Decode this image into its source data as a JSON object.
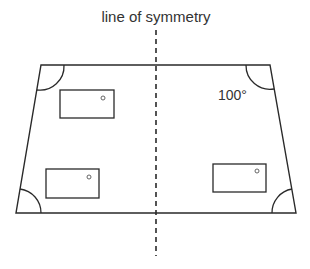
{
  "diagram": {
    "title": "line of symmetry",
    "angle_label": "100°",
    "colors": {
      "stroke": "#2a2a2a",
      "text": "#333333",
      "background": "#ffffff"
    },
    "shape": {
      "type": "isosceles trapezium",
      "vertices": {
        "top_left": [
          41,
          65
        ],
        "top_right": [
          270,
          65
        ],
        "bottom_right": [
          296,
          213
        ],
        "bottom_left": [
          16,
          213
        ]
      }
    },
    "axis_of_symmetry": {
      "x": 156,
      "y_start": 30,
      "y_end": 256,
      "style": "dashed"
    },
    "angle_marks": [
      {
        "corner": "top_left"
      },
      {
        "corner": "top_right",
        "label": "100°"
      },
      {
        "corner": "bottom_left"
      },
      {
        "corner": "bottom_right"
      }
    ],
    "windows": [
      {
        "name": "window-top-left",
        "x": 60,
        "y": 90,
        "w": 54,
        "h": 28,
        "knob": [
          103,
          98
        ]
      },
      {
        "name": "window-bottom-left",
        "x": 46,
        "y": 169,
        "w": 53,
        "h": 29,
        "knob": [
          89,
          177
        ]
      },
      {
        "name": "window-bottom-right",
        "x": 213,
        "y": 164,
        "w": 53,
        "h": 28,
        "knob": [
          257,
          171
        ]
      }
    ]
  }
}
